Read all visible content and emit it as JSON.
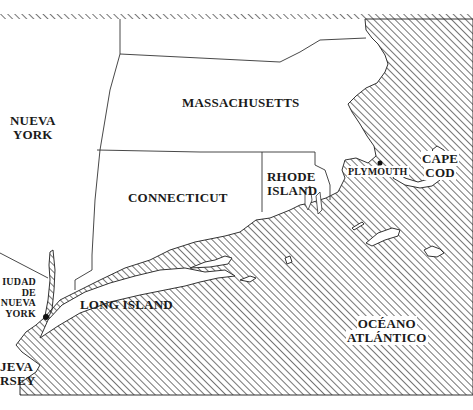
{
  "map": {
    "language": "es",
    "colors": {
      "land": "#ffffff",
      "water_hatch": "#2a2a2a",
      "border": "#333333",
      "text": "#1a1a1a"
    },
    "labels": {
      "nueva_york_1": "NUEVA",
      "nueva_york_2": "YORK",
      "massachusetts": "MASSACHUSETTS",
      "connecticut": "CONNECTICUT",
      "rhode_island_1": "RHODE",
      "rhode_island_2": "ISLAND",
      "plymouth": "PLYMOUTH",
      "cape_cod_1": "CAPE",
      "cape_cod_2": "COD",
      "ciudad_nueva_york_1": "IUDAD",
      "ciudad_nueva_york_2": "DE",
      "ciudad_nueva_york_3": "NUEVA",
      "ciudad_nueva_york_4": "YORK",
      "long_island": "LONG ISLAND",
      "nueva_jersey_1": "JEVA",
      "nueva_jersey_2": "RSEY",
      "oceano_1": "OCÉANO",
      "oceano_2": "ATLÁNTICO"
    },
    "markers": [
      {
        "name": "Plymouth",
        "x": 380,
        "y": 163
      },
      {
        "name": "Ciudad de Nueva York",
        "x": 46,
        "y": 317
      }
    ]
  }
}
